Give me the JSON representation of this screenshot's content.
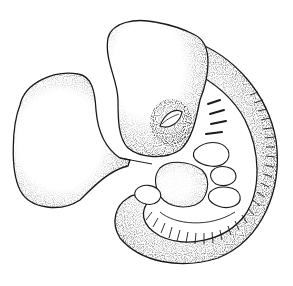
{
  "image": {
    "subject": "stippled illustration of a vertebrate embryo",
    "style": "black ink stipple drawing on white background",
    "width": 293,
    "height": 286,
    "colors": {
      "background": "#ffffff",
      "ink": "#1a1a1a"
    },
    "parts": [
      {
        "name": "yolk-sac",
        "label": "Yolk sac"
      },
      {
        "name": "head",
        "label": "Head"
      },
      {
        "name": "eye",
        "label": "Eye"
      },
      {
        "name": "pharyngeal-arches",
        "label": "Pharyngeal arches"
      },
      {
        "name": "heart",
        "label": "Heart bulge"
      },
      {
        "name": "forelimb-bud",
        "label": "Forelimb bud"
      },
      {
        "name": "hindlimb-bud",
        "label": "Hindlimb bud"
      },
      {
        "name": "tail",
        "label": "Tail"
      },
      {
        "name": "somites",
        "label": "Somites"
      }
    ]
  }
}
